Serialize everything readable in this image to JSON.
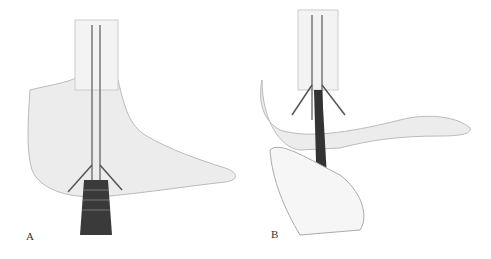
{
  "figure": {
    "panels": [
      {
        "label": "A",
        "description": "Foot illustration with two guide wires and a cannulated drill with ribbed handle inserted from below the heel"
      },
      {
        "label": "B",
        "description": "Foot illustration with two guide wires and a drill sleeve held by a hand"
      }
    ]
  }
}
